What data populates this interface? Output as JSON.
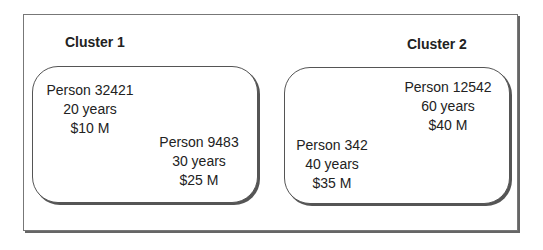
{
  "clusters": [
    {
      "title": "Cluster 1",
      "people": [
        {
          "name": "Person 32421",
          "age": "20 years",
          "value": "$10 M"
        },
        {
          "name": "Person 9483",
          "age": "30 years",
          "value": "$25 M"
        }
      ]
    },
    {
      "title": "Cluster 2",
      "people": [
        {
          "name": "Person 12542",
          "age": "60 years",
          "value": "$40 M"
        },
        {
          "name": "Person 342",
          "age": "40 years",
          "value": "$35 M"
        }
      ]
    }
  ]
}
